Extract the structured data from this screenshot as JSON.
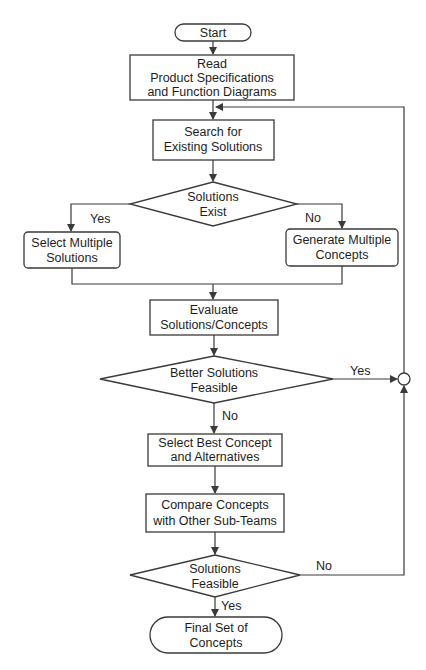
{
  "diagram": {
    "type": "flowchart",
    "nodes": {
      "start": {
        "shape": "terminator",
        "lines": [
          "Start"
        ]
      },
      "read": {
        "shape": "process",
        "lines": [
          "Read",
          "Product Specifications",
          "and Function Diagrams"
        ]
      },
      "search": {
        "shape": "process",
        "lines": [
          "Search for",
          "Existing Solutions"
        ]
      },
      "solutions_exist": {
        "shape": "decision",
        "lines": [
          "Solutions",
          "Exist"
        ]
      },
      "select_multiple": {
        "shape": "rounded-process",
        "lines": [
          "Select Multiple",
          "Solutions"
        ]
      },
      "generate_multiple": {
        "shape": "rounded-process",
        "lines": [
          "Generate Multiple",
          "Concepts"
        ]
      },
      "evaluate": {
        "shape": "process",
        "lines": [
          "Evaluate",
          "Solutions/Concepts"
        ]
      },
      "better_feasible": {
        "shape": "decision",
        "lines": [
          "Better Solutions",
          "Feasible"
        ]
      },
      "select_best": {
        "shape": "process",
        "lines": [
          "Select Best Concept",
          "and Alternatives"
        ]
      },
      "compare": {
        "shape": "process",
        "lines": [
          "Compare Concepts",
          "with Other Sub-Teams"
        ]
      },
      "solutions_feasible": {
        "shape": "decision",
        "lines": [
          "Solutions",
          "Feasible"
        ]
      },
      "final": {
        "shape": "terminator",
        "lines": [
          "Final Set of",
          "Concepts"
        ]
      }
    },
    "edge_labels": {
      "exist_yes": "Yes",
      "exist_no": "No",
      "better_yes": "Yes",
      "better_no": "No",
      "feasible_no": "No",
      "feasible_yes": "Yes"
    },
    "edges": [
      {
        "from": "start",
        "to": "read"
      },
      {
        "from": "read",
        "to": "search"
      },
      {
        "from": "search",
        "to": "solutions_exist"
      },
      {
        "from": "solutions_exist",
        "to": "select_multiple",
        "label": "Yes"
      },
      {
        "from": "solutions_exist",
        "to": "generate_multiple",
        "label": "No"
      },
      {
        "from": "select_multiple",
        "to": "evaluate"
      },
      {
        "from": "generate_multiple",
        "to": "evaluate"
      },
      {
        "from": "evaluate",
        "to": "better_feasible"
      },
      {
        "from": "better_feasible",
        "to": "junction",
        "label": "Yes"
      },
      {
        "from": "better_feasible",
        "to": "select_best",
        "label": "No"
      },
      {
        "from": "select_best",
        "to": "compare"
      },
      {
        "from": "compare",
        "to": "solutions_feasible"
      },
      {
        "from": "solutions_feasible",
        "to": "junction",
        "label": "No"
      },
      {
        "from": "solutions_feasible",
        "to": "final",
        "label": "Yes"
      },
      {
        "from": "junction",
        "to": "search"
      }
    ],
    "colors": {
      "stroke": "#3a3a3a",
      "text": "#1e1e1e",
      "background": "#ffffff"
    }
  }
}
